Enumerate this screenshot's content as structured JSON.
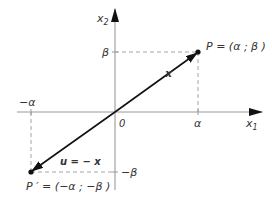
{
  "diagram": {
    "type": "vector-reflection-through-origin",
    "axes": {
      "x_label": "x",
      "x_sub": "1",
      "y_label": "x",
      "y_sub": "2",
      "origin_label": "0",
      "axis_color": "#9a9a9a"
    },
    "ticks": {
      "alpha": "α",
      "neg_alpha": "−α",
      "beta": "β",
      "neg_beta": "−β"
    },
    "points": {
      "P": {
        "label": "P = (α ; β )"
      },
      "P_prime": {
        "label": "P ′ = (−α ; −β )"
      }
    },
    "vectors": {
      "x": {
        "label": "x",
        "color": "#111111"
      },
      "u": {
        "label": "u = − x",
        "color": "#111111"
      }
    },
    "colors": {
      "guide_dash": "#999999",
      "point": "#111111",
      "text": "#333333"
    }
  }
}
